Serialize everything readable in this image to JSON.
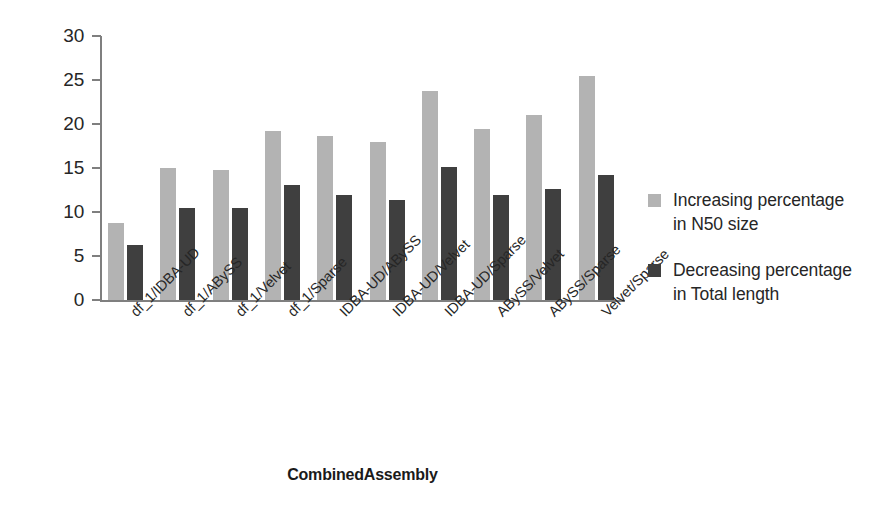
{
  "chart_data": {
    "type": "bar",
    "title": "",
    "xlabel": "CombinedAssembly",
    "ylabel": "",
    "ylim": [
      0,
      30
    ],
    "yticks": [
      0,
      5,
      10,
      15,
      20,
      25,
      30
    ],
    "grid": false,
    "legend_position": "right",
    "categories": [
      "df_1/IDBA-UD",
      "df_1/ABySS",
      "df_1/Velvet",
      "df_1/Sparse",
      "IDBA-UD/ABySS",
      "IDBA-UD/Velvet",
      "IDBA-UD/Sparse",
      "ABySS/Velvet",
      "ABySS/Sparse",
      "Velvet/Sparse"
    ],
    "series": [
      {
        "name": "Increasing percentage in N50 size",
        "name_line1": "Increasing percentage",
        "name_line2": "in N50 size",
        "color": "#b3b3b3",
        "values": [
          8.8,
          15.0,
          14.8,
          19.2,
          18.6,
          17.9,
          23.7,
          19.4,
          21.0,
          25.5
        ]
      },
      {
        "name": "Decreasing percentage in Total length",
        "name_line1": "Decreasing percentage",
        "name_line2": "in Total length",
        "color": "#3f3f3f",
        "values": [
          6.2,
          10.5,
          10.4,
          13.1,
          11.9,
          11.4,
          15.1,
          11.9,
          12.6,
          14.2
        ]
      }
    ]
  },
  "axis": {
    "y_tick_labels": [
      "0",
      "5",
      "10",
      "15",
      "20",
      "25",
      "30"
    ],
    "x_title": "CombinedAssembly"
  },
  "colors": {
    "series_a": "#b3b3b3",
    "series_b": "#3f3f3f",
    "axis": "#7f7f7f",
    "text": "#262626",
    "background": "#ffffff"
  }
}
